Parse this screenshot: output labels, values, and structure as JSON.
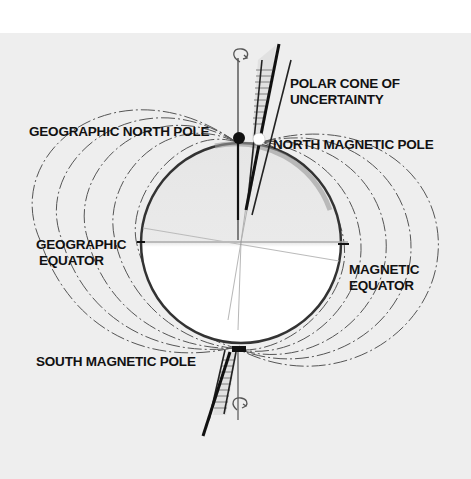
{
  "diagram": {
    "labels": {
      "polar_cone": [
        "POLAR CONE OF",
        "UNCERTAINTY"
      ],
      "geographic_north_pole": "GEOGRAPHIC NORTH POLE",
      "north_magnetic_pole": "NORTH MAGNETIC POLE",
      "geographic_equator": [
        "GEOGRAPHIC",
        "EQUATOR"
      ],
      "magnetic_equator": [
        "MAGNETIC",
        "EQUATOR"
      ],
      "south_magnetic_pole": "SOUTH MAGNETIC POLE"
    },
    "elements": [
      {
        "name": "earth-circle",
        "center": [
          241,
          242
        ],
        "radius": 100
      },
      {
        "name": "geographic-north-pole-marker",
        "fill": "#111111"
      },
      {
        "name": "north-magnetic-pole-marker",
        "fill": "#ffffff"
      },
      {
        "name": "rotation-arrow-top"
      },
      {
        "name": "rotation-arrow-bottom"
      },
      {
        "name": "magnetic-field-lines",
        "count_per_side": 5
      }
    ],
    "colors": {
      "paper": "#eeeeee",
      "ink": "#111111",
      "field_line": "#555555",
      "equator_line": "#aaaaaa"
    }
  }
}
